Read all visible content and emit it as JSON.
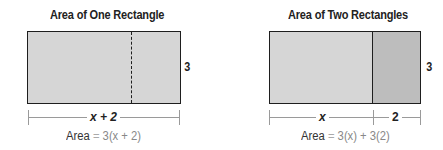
{
  "diagrams": [
    {
      "title": "Area of One Rectangle",
      "side_label": "3",
      "bottom_label": "x + 2",
      "area_label": "Area",
      "area_equals": "=",
      "area_expression": "3(x + 2)",
      "fill_color": "#d6d6d6",
      "divider_style": "dashed"
    },
    {
      "title": "Area of Two Rectangles",
      "side_label": "3",
      "bottom_labels": [
        "x",
        "2"
      ],
      "area_label": "Area",
      "area_equals": "=",
      "area_expression": "3(x) + 3(2)",
      "fill_colors": [
        "#d6d6d6",
        "#bdbdbd"
      ],
      "divider_style": "solid"
    }
  ]
}
